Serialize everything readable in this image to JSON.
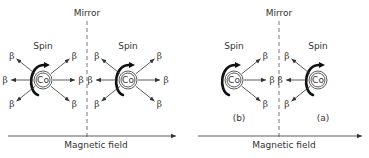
{
  "panels": [
    {
      "id": "left",
      "mirror_label": "Mirror",
      "field_label": "Magnetic field",
      "nuclei": [
        {
          "label": "Co",
          "spin_label": "Spin",
          "spin_arrow_side": "left",
          "beta_directions": [
            "up-left",
            "left",
            "down-left",
            "up-right",
            "right",
            "down-right"
          ]
        },
        {
          "label": "Co",
          "spin_label": "Spin",
          "spin_arrow_side": "left",
          "beta_directions": [
            "up-left",
            "left",
            "down-left",
            "up-right",
            "right",
            "down-right"
          ]
        }
      ],
      "case_labels": []
    },
    {
      "id": "right",
      "mirror_label": "Mirror",
      "field_label": "Magnetic field",
      "nuclei": [
        {
          "label": "Co",
          "spin_label": "Spin",
          "spin_arrow_side": "left",
          "beta_directions": [
            "up-right",
            "right",
            "down-right"
          ],
          "case_label": "(b)"
        },
        {
          "label": "Co",
          "spin_label": "Spin",
          "spin_arrow_side": "left",
          "beta_directions": [
            "up-left",
            "left",
            "down-left"
          ],
          "case_label": "(a)"
        }
      ]
    }
  ],
  "beta_symbol": "β"
}
